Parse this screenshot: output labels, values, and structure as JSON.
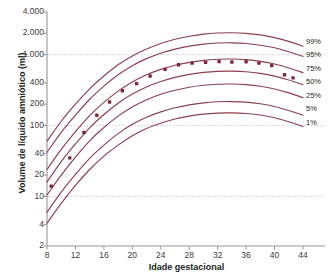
{
  "chart_data": {
    "type": "line",
    "title": "",
    "xlabel": "Idade gestacional",
    "ylabel": "Volume de líquido amniótico (ml)",
    "xlim": [
      8,
      44
    ],
    "ylim": [
      2,
      4000
    ],
    "yscale": "log",
    "grid": "horizontal dashed at 10, 100, 1.000",
    "gridlines": [
      10,
      100,
      1000
    ],
    "xticks": [
      8,
      12,
      16,
      20,
      24,
      28,
      32,
      36,
      40,
      44
    ],
    "xtick_labels": [
      "8",
      "12",
      "16",
      "20",
      "24",
      "28",
      "32",
      "36",
      "40",
      "44"
    ],
    "yticks": [
      2,
      4,
      10,
      20,
      40,
      100,
      200,
      400,
      1000,
      2000,
      4000
    ],
    "ytick_labels": [
      "2",
      "4",
      "10",
      "20",
      "40",
      "100",
      "200",
      "400",
      "1.000",
      "2.000",
      "4.000"
    ],
    "legend_position": "right",
    "legend": [
      "99%",
      "95%",
      "75%",
      "50%",
      "25%",
      "5%",
      "1%"
    ],
    "line_color": "#8e4050",
    "marker_color": "#7d2736",
    "grid_color": "#c9c3c4",
    "axis_color": "#9a9496",
    "series": [
      {
        "name": "99%",
        "x": [
          8,
          10,
          12,
          14,
          16,
          18,
          20,
          22,
          24,
          26,
          28,
          30,
          32,
          34,
          36,
          38,
          40,
          42,
          44
        ],
        "values": [
          60,
          115,
          200,
          330,
          500,
          720,
          960,
          1200,
          1440,
          1650,
          1820,
          1950,
          2020,
          2040,
          2000,
          1900,
          1740,
          1540,
          1320
        ]
      },
      {
        "name": "95%",
        "x": [
          8,
          10,
          12,
          14,
          16,
          18,
          20,
          22,
          24,
          26,
          28,
          30,
          32,
          34,
          36,
          38,
          40,
          42,
          44
        ],
        "values": [
          42,
          80,
          140,
          235,
          360,
          520,
          700,
          880,
          1050,
          1200,
          1320,
          1410,
          1460,
          1470,
          1440,
          1360,
          1250,
          1100,
          945
        ]
      },
      {
        "name": "75%",
        "x": [
          8,
          10,
          12,
          14,
          16,
          18,
          20,
          22,
          24,
          26,
          28,
          30,
          32,
          34,
          36,
          38,
          40,
          42,
          44
        ],
        "values": [
          24,
          46,
          82,
          138,
          212,
          306,
          412,
          520,
          620,
          710,
          780,
          832,
          862,
          868,
          850,
          805,
          738,
          650,
          558
        ]
      },
      {
        "name": "50%",
        "x": [
          8,
          10,
          12,
          14,
          16,
          18,
          20,
          22,
          24,
          26,
          28,
          30,
          32,
          34,
          36,
          38,
          40,
          42,
          44
        ],
        "values": [
          16,
          31,
          55,
          93,
          143,
          207,
          278,
          351,
          419,
          479,
          527,
          562,
          582,
          586,
          574,
          544,
          498,
          439,
          377
        ]
      },
      {
        "name": "25%",
        "x": [
          8,
          10,
          12,
          14,
          16,
          18,
          20,
          22,
          24,
          26,
          28,
          30,
          32,
          34,
          36,
          38,
          40,
          42,
          44
        ],
        "values": [
          10.5,
          20,
          36,
          61,
          94,
          136,
          183,
          231,
          276,
          315,
          347,
          370,
          383,
          386,
          378,
          358,
          328,
          289,
          248
        ]
      },
      {
        "name": "5%",
        "x": [
          8,
          10,
          12,
          14,
          16,
          18,
          20,
          22,
          24,
          26,
          28,
          30,
          32,
          34,
          36,
          38,
          40,
          42,
          44
        ],
        "values": [
          6.0,
          11.5,
          20.5,
          34.5,
          53,
          77,
          104,
          131,
          156,
          178,
          196,
          209,
          217,
          218,
          214,
          203,
          186,
          163,
          140
        ]
      },
      {
        "name": "1%",
        "x": [
          8,
          10,
          12,
          14,
          16,
          18,
          20,
          22,
          24,
          26,
          28,
          30,
          32,
          34,
          36,
          38,
          40,
          42,
          44
        ],
        "values": [
          4.2,
          8.0,
          14.3,
          24,
          37,
          53,
          72,
          91,
          108,
          124,
          136,
          145,
          150,
          151,
          148,
          141,
          129,
          113,
          97
        ]
      }
    ],
    "points": {
      "name": "observed median",
      "x": [
        8.6,
        11.2,
        13.2,
        15.0,
        16.8,
        18.6,
        20.6,
        22.5,
        24.6,
        26.5,
        28.4,
        30.3,
        32.2,
        34.0,
        36.0,
        37.8,
        39.6,
        41.4,
        42.6
      ],
      "values": [
        14,
        35,
        80,
        140,
        215,
        310,
        390,
        500,
        620,
        720,
        760,
        780,
        800,
        790,
        795,
        760,
        700,
        520,
        470
      ]
    }
  }
}
